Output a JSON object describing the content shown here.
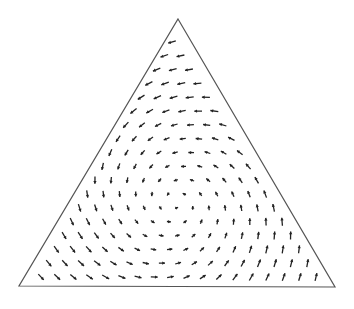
{
  "diagram": {
    "type": "simplex-vector-field",
    "triangle": {
      "apex": [
        178,
        19
      ],
      "bottom_left": [
        19,
        286
      ],
      "bottom_right": [
        335,
        287
      ],
      "stroke": "#555555"
    },
    "grid": {
      "rows": 18,
      "top_point": [
        172,
        42
      ],
      "bottom_row_y": 277,
      "bottom_row_x_start": 41,
      "bottom_row_x_end": 316
    },
    "field": {
      "center": [
        176,
        203
      ],
      "rotation": "counter-clockwise",
      "arrow_color": "#222222",
      "max_length": 8,
      "min_length": 3
    }
  }
}
